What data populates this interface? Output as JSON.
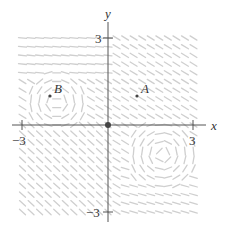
{
  "diagram": {
    "type": "slope_field",
    "axes": {
      "x_label": "x",
      "y_label": "y",
      "x_ticks": [
        {
          "value": -3,
          "label": "−3"
        },
        {
          "value": 3,
          "label": "3"
        }
      ],
      "y_ticks": [
        {
          "value": 3,
          "label": "3"
        },
        {
          "value": -3,
          "label": "−3"
        }
      ],
      "range": {
        "x": [
          -3,
          3
        ],
        "y": [
          -3,
          3
        ]
      }
    },
    "points": [
      {
        "name": "origin",
        "label": "",
        "x": 0,
        "y": 0
      },
      {
        "name": "A",
        "label": "A",
        "x": 1,
        "y": 1
      },
      {
        "name": "B",
        "label": "B",
        "x": -2,
        "y": 1
      }
    ],
    "colors": {
      "axis": "#555555",
      "field": "#cfcfcf",
      "point": "#444444",
      "text": "#333333"
    }
  }
}
